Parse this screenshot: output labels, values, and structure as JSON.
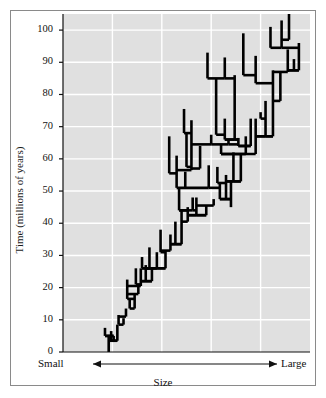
{
  "figure": {
    "background_color": "#ffffff",
    "frame_color": "#8a8a8a",
    "plot_background_color": "#e0e0e0",
    "gridline_color": "#ffffff",
    "tree_color": "#000000"
  },
  "axes": {
    "y_axis_title": "Time (millions of years)",
    "y_ticks": [
      0,
      10,
      20,
      30,
      40,
      50,
      60,
      70,
      80,
      90,
      100
    ],
    "y_tick_labels": [
      "0",
      "10",
      "20",
      "30",
      "40",
      "50",
      "60",
      "70",
      "80",
      "90",
      "100"
    ],
    "y_min": 0,
    "y_max": 105,
    "x_axis_title": "Size",
    "x_left_label": "Small",
    "x_right_label": "Large",
    "x_arrow_left": "◀",
    "x_arrow_right": "▶",
    "x_min": 0,
    "x_max": 100
  },
  "chart_data": {
    "type": "line",
    "title": "",
    "subtitle": "",
    "xlabel": "Size",
    "ylabel": "Time (millions of years)",
    "xlim": [
      0,
      100
    ],
    "ylim": [
      0,
      105
    ],
    "grid": true,
    "legend": "none",
    "annotations": [
      {
        "text": "Small",
        "position": "x-axis-left"
      },
      {
        "text": "Large",
        "position": "x-axis-right"
      },
      {
        "text": "Size",
        "position": "x-axis-title"
      },
      {
        "text": "Time (millions of years)",
        "position": "y-axis-title"
      }
    ],
    "root": {
      "x": 18.5,
      "t_start": 0,
      "t_end": 5
    },
    "branches": [
      {
        "id": "b1",
        "x": 18.5,
        "t0": 0,
        "t1": 5.0
      },
      {
        "id": "b2",
        "x": 17.0,
        "t0": 5.0,
        "t1": 7.5
      },
      {
        "id": "b3",
        "x": 20.5,
        "t0": 5.0,
        "t1": 3.5
      },
      {
        "id": "b4",
        "x": 22.0,
        "t0": 3.5,
        "t1": 8.5
      },
      {
        "id": "b5",
        "x": 19.5,
        "t0": 3.5,
        "t1": 6.5
      },
      {
        "id": "b6",
        "x": 22.5,
        "t0": 8.5,
        "t1": 11.5
      },
      {
        "id": "b7",
        "x": 24.5,
        "t0": 8.5,
        "t1": 10.5
      },
      {
        "id": "b8",
        "x": 25.5,
        "t0": 11.0,
        "t1": 13.5
      },
      {
        "id": "b9",
        "x": 27.0,
        "t0": 13.5,
        "t1": 16.5
      },
      {
        "id": "b10",
        "x": 29.0,
        "t0": 13.5,
        "t1": 18.0
      },
      {
        "id": "b11",
        "x": 26.0,
        "t0": 16.5,
        "t1": 22.5
      },
      {
        "id": "b12",
        "x": 30.5,
        "t0": 18.0,
        "t1": 20.5
      },
      {
        "id": "b13",
        "x": 31.5,
        "t0": 20.5,
        "t1": 26.0
      },
      {
        "id": "b14",
        "x": 29.5,
        "t0": 21.0,
        "t1": 26.0
      },
      {
        "id": "b15",
        "x": 32.0,
        "t0": 26.0,
        "t1": 29.5
      },
      {
        "id": "b16",
        "x": 35.0,
        "t0": 26.0,
        "t1": 32.5
      },
      {
        "id": "b17",
        "x": 33.5,
        "t0": 22.0,
        "t1": 27.0
      },
      {
        "id": "b18",
        "x": 36.0,
        "t0": 22.0,
        "t1": 26.0
      },
      {
        "id": "b19",
        "x": 38.0,
        "t0": 26.0,
        "t1": 31.0
      },
      {
        "id": "b20",
        "x": 41.5,
        "t0": 26.0,
        "t1": 31.5
      },
      {
        "id": "b21",
        "x": 39.5,
        "t0": 31.0,
        "t1": 38.0
      },
      {
        "id": "b22",
        "x": 43.5,
        "t0": 31.5,
        "t1": 36.5
      },
      {
        "id": "b23",
        "x": 45.5,
        "t0": 33.5,
        "t1": 40.5
      },
      {
        "id": "b24",
        "x": 48.0,
        "t0": 33.5,
        "t1": 44.0
      },
      {
        "id": "b25",
        "x": 50.5,
        "t0": 40.5,
        "t1": 45.0
      },
      {
        "id": "b26",
        "x": 52.5,
        "t0": 44.0,
        "t1": 48.0
      },
      {
        "id": "b27",
        "x": 47.0,
        "t0": 44.0,
        "t1": 51.0
      },
      {
        "id": "b28",
        "x": 49.5,
        "t0": 51.0,
        "t1": 56.0
      },
      {
        "id": "b29",
        "x": 46.0,
        "t0": 51.0,
        "t1": 61.0
      },
      {
        "id": "b30",
        "x": 43.0,
        "t0": 55.5,
        "t1": 67.0
      },
      {
        "id": "b31",
        "x": 52.0,
        "t0": 56.5,
        "t1": 72.0
      },
      {
        "id": "b32",
        "x": 50.0,
        "t0": 57.5,
        "t1": 68.0
      },
      {
        "id": "b33",
        "x": 49.0,
        "t0": 68.0,
        "t1": 75.5
      },
      {
        "id": "b34",
        "x": 55.5,
        "t0": 57.0,
        "t1": 64.0
      },
      {
        "id": "b35",
        "x": 54.0,
        "t0": 42.5,
        "t1": 48.0
      },
      {
        "id": "b36",
        "x": 58.0,
        "t0": 42.5,
        "t1": 45.5
      },
      {
        "id": "b37",
        "x": 61.0,
        "t0": 45.5,
        "t1": 47.5
      },
      {
        "id": "b38",
        "x": 63.5,
        "t0": 47.5,
        "t1": 52.5
      },
      {
        "id": "b39",
        "x": 66.0,
        "t0": 47.5,
        "t1": 55.0
      },
      {
        "id": "b40",
        "x": 59.0,
        "t0": 51.0,
        "t1": 58.0
      },
      {
        "id": "b41",
        "x": 62.5,
        "t0": 52.5,
        "t1": 57.5
      },
      {
        "id": "b42",
        "x": 68.0,
        "t0": 45.0,
        "t1": 53.0
      },
      {
        "id": "b43",
        "x": 72.0,
        "t0": 53.0,
        "t1": 61.5
      },
      {
        "id": "b44",
        "x": 69.0,
        "t0": 53.0,
        "t1": 62.0
      },
      {
        "id": "b45",
        "x": 74.0,
        "t0": 61.5,
        "t1": 67.0
      },
      {
        "id": "b46",
        "x": 78.0,
        "t0": 61.5,
        "t1": 72.5
      },
      {
        "id": "b47",
        "x": 82.0,
        "t0": 67.0,
        "t1": 78.0
      },
      {
        "id": "b48",
        "x": 85.0,
        "t0": 67.0,
        "t1": 87.5
      },
      {
        "id": "b49",
        "x": 80.0,
        "t0": 72.5,
        "t1": 74.5
      },
      {
        "id": "b50",
        "x": 88.0,
        "t0": 78.0,
        "t1": 87.0
      },
      {
        "id": "b51",
        "x": 91.0,
        "t0": 87.0,
        "t1": 94.0
      },
      {
        "id": "b52",
        "x": 93.5,
        "t0": 87.5,
        "t1": 91.0
      },
      {
        "id": "b53",
        "x": 95.5,
        "t0": 87.5,
        "t1": 96.0
      },
      {
        "id": "b54",
        "x": 71.0,
        "t0": 64.0,
        "t1": 66.5
      },
      {
        "id": "b55",
        "x": 76.0,
        "t0": 64.0,
        "t1": 72.5
      },
      {
        "id": "b56",
        "x": 64.0,
        "t0": 61.5,
        "t1": 64.5
      },
      {
        "id": "b57",
        "x": 60.0,
        "t0": 64.5,
        "t1": 67.5
      },
      {
        "id": "b58",
        "x": 67.0,
        "t0": 64.5,
        "t1": 66.0
      },
      {
        "id": "b59",
        "x": 65.5,
        "t0": 66.0,
        "t1": 72.5
      },
      {
        "id": "b60",
        "x": 69.5,
        "t0": 66.0,
        "t1": 86.0
      },
      {
        "id": "b61",
        "x": 62.0,
        "t0": 67.5,
        "t1": 85.0
      },
      {
        "id": "b62",
        "x": 58.5,
        "t0": 85.0,
        "t1": 93.0
      },
      {
        "id": "b63",
        "x": 65.5,
        "t0": 85.0,
        "t1": 91.5
      },
      {
        "id": "b64",
        "x": 73.0,
        "t0": 86.0,
        "t1": 99.0
      },
      {
        "id": "b65",
        "x": 78.0,
        "t0": 83.5,
        "t1": 92.0
      },
      {
        "id": "b66",
        "x": 84.0,
        "t0": 94.5,
        "t1": 101.0
      },
      {
        "id": "b67",
        "x": 88.5,
        "t0": 94.5,
        "t1": 103.0
      },
      {
        "id": "b68",
        "x": 91.5,
        "t0": 97.0,
        "t1": 105.0
      }
    ]
  }
}
